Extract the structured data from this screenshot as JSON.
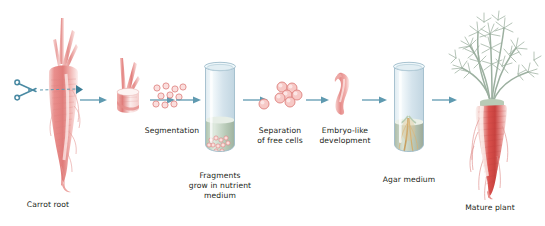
{
  "figure": {
    "type": "process-flow-diagram",
    "background_color": "#ffffff",
    "arrow_color": "#5f9ab0",
    "tissue_color": "#e08a8a",
    "glass_color": "#cfe0e8",
    "medium_color": "#b8cbb8",
    "agar_color": "#c3cfbe",
    "foliage_color": "#9fb3a3"
  },
  "steps": [
    {
      "id": "carrot-root",
      "label": "Carrot root",
      "label_lines": [
        "Carrot root"
      ]
    },
    {
      "id": "excised-piece",
      "label": "",
      "label_lines": []
    },
    {
      "id": "segmentation",
      "label": "Segmentation",
      "label_lines": [
        "Segmentation"
      ]
    },
    {
      "id": "nutrient-tube",
      "label": "Fragments grow in nutrient medium",
      "label_lines": [
        "Fragments",
        "grow in nutrient",
        "medium"
      ]
    },
    {
      "id": "free-cells",
      "label": "Separation of free cells",
      "label_lines": [
        "Separation",
        "of free cells"
      ]
    },
    {
      "id": "embryo",
      "label": "Embryo-like development",
      "label_lines": [
        "Embryo-like",
        "development"
      ]
    },
    {
      "id": "agar-tube",
      "label": "Agar medium",
      "label_lines": [
        "Agar medium"
      ]
    },
    {
      "id": "mature-plant",
      "label": "Mature plant",
      "label_lines": [
        "Mature plant"
      ]
    }
  ],
  "icons": {
    "scissors": "scissors-icon",
    "cut_line": "dashed-cut-line"
  },
  "arrows": [
    {
      "from": "carrot-root",
      "to": "excised-piece"
    },
    {
      "from": "excised-piece",
      "to": "segmentation"
    },
    {
      "from": "segmentation",
      "to": "nutrient-tube"
    },
    {
      "from": "nutrient-tube",
      "to": "free-cells"
    },
    {
      "from": "free-cells",
      "to": "embryo"
    },
    {
      "from": "embryo",
      "to": "agar-tube"
    },
    {
      "from": "agar-tube",
      "to": "mature-plant"
    }
  ]
}
